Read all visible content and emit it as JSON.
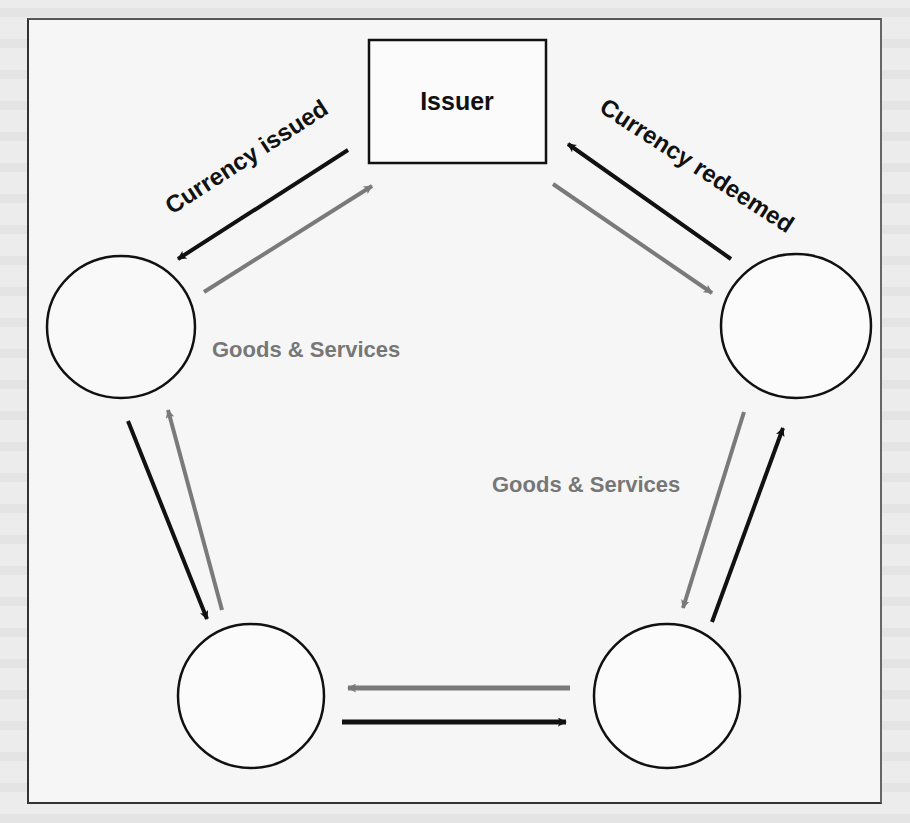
{
  "diagram": {
    "title": "",
    "nodes": [
      {
        "id": "issuer",
        "shape": "rectangle",
        "label": "Issuer"
      },
      {
        "id": "participant_top_left",
        "shape": "circle",
        "label": ""
      },
      {
        "id": "participant_top_right",
        "shape": "circle",
        "label": ""
      },
      {
        "id": "participant_bottom_left",
        "shape": "circle",
        "label": ""
      },
      {
        "id": "participant_bottom_right",
        "shape": "circle",
        "label": ""
      }
    ],
    "edges": [
      {
        "from": "issuer",
        "to": "participant_top_left",
        "color": "black",
        "label": "Currency issued"
      },
      {
        "from": "participant_top_left",
        "to": "issuer",
        "color": "gray",
        "label": ""
      },
      {
        "from": "participant_top_right",
        "to": "issuer",
        "color": "black",
        "label": "Currency redeemed"
      },
      {
        "from": "issuer",
        "to": "participant_top_right",
        "color": "gray",
        "label": ""
      },
      {
        "from": "participant_top_left",
        "to": "participant_bottom_left",
        "color": "black",
        "label": ""
      },
      {
        "from": "participant_bottom_left",
        "to": "participant_top_left",
        "color": "gray",
        "label": ""
      },
      {
        "from": "participant_bottom_left",
        "to": "participant_bottom_right",
        "color": "black",
        "label": ""
      },
      {
        "from": "participant_bottom_right",
        "to": "participant_bottom_left",
        "color": "gray",
        "label": ""
      },
      {
        "from": "participant_bottom_right",
        "to": "participant_top_right",
        "color": "black",
        "label": ""
      },
      {
        "from": "participant_top_right",
        "to": "participant_bottom_right",
        "color": "gray",
        "label": ""
      }
    ],
    "labels": {
      "issuer": "Issuer",
      "currency_issued": "Currency issued",
      "currency_redeemed": "Currency redeemed",
      "goods_services_left": "Goods & Services",
      "goods_services_right": "Goods & Services"
    },
    "legend_colors": {
      "currency_flow": "#111111",
      "goods_services_flow": "#7a7a7a"
    }
  }
}
